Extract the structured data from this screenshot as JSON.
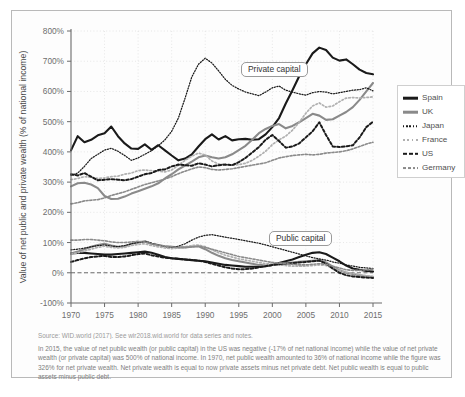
{
  "figure": {
    "source_note": "Source: WID.world (2017). See wir2018.wid.world for data series and notes.",
    "caption": "In 2015, the value of net public wealth (or public capital) in the US was negative (-17% of net national income) while the value of net private wealth (or private capital) was 500% of national income. In 1970, net public wealth amounted to 36% of national income while the figure was 326% for net private wealth. Net private wealth is equal to now private assets minus net private debt. Net public wealth is equal to public assets minus public debt."
  },
  "chart_data": {
    "type": "line",
    "title": "",
    "xlabel": "",
    "ylabel": "Value of net public and private wealth (% of national income)",
    "xlim": [
      1970,
      2015
    ],
    "ylim": [
      -100,
      800
    ],
    "ytick_labels": [
      "800%",
      "700%",
      "600%",
      "500%",
      "400%",
      "300%",
      "200%",
      "100%",
      "0%",
      "-100%"
    ],
    "yticks": [
      800,
      700,
      600,
      500,
      400,
      300,
      200,
      100,
      0,
      -100
    ],
    "xticks": [
      1970,
      1975,
      1980,
      1985,
      1990,
      1995,
      2000,
      2005,
      2010,
      2015
    ],
    "xtick_labels": [
      "1970",
      "1975",
      "1980",
      "1985",
      "1990",
      "1995",
      "2000",
      "2005",
      "2010",
      "2015"
    ],
    "grid": true,
    "legend_position": "right",
    "annotations": [
      {
        "name": "private-capital",
        "text": "Private capital"
      },
      {
        "name": "public-capital",
        "text": "Public capital"
      }
    ],
    "x": [
      1970,
      1971,
      1972,
      1973,
      1974,
      1975,
      1976,
      1977,
      1978,
      1979,
      1980,
      1981,
      1982,
      1983,
      1984,
      1985,
      1986,
      1987,
      1988,
      1989,
      1990,
      1991,
      1992,
      1993,
      1994,
      1995,
      1996,
      1997,
      1998,
      1999,
      2000,
      2001,
      2002,
      2003,
      2004,
      2005,
      2006,
      2007,
      2008,
      2009,
      2010,
      2011,
      2012,
      2013,
      2014,
      2015
    ],
    "series": [
      {
        "name": "Spain",
        "group": "private",
        "color": "#1a1a1a",
        "style": "solid",
        "width": 2.1,
        "values": [
          405,
          452,
          432,
          440,
          455,
          462,
          484,
          452,
          428,
          411,
          410,
          425,
          407,
          422,
          405,
          388,
          372,
          378,
          392,
          418,
          442,
          458,
          441,
          452,
          438,
          442,
          443,
          440,
          442,
          458,
          482,
          512,
          560,
          604,
          650,
          690,
          726,
          745,
          737,
          712,
          702,
          706,
          690,
          672,
          661,
          657
        ]
      },
      {
        "name": "UK",
        "group": "private",
        "color": "#8a8a8a",
        "style": "solid",
        "width": 2.1,
        "values": [
          286,
          296,
          298,
          292,
          280,
          254,
          244,
          245,
          252,
          262,
          270,
          278,
          286,
          296,
          312,
          326,
          342,
          355,
          368,
          382,
          388,
          382,
          378,
          382,
          392,
          406,
          420,
          440,
          462,
          476,
          486,
          492,
          478,
          486,
          498,
          512,
          526,
          520,
          506,
          508,
          520,
          532,
          548,
          572,
          600,
          628
        ]
      },
      {
        "name": "Japan",
        "group": "private",
        "color": "#1a1a1a",
        "style": "dotted",
        "width": 1.25,
        "values": [
          322,
          330,
          352,
          378,
          392,
          406,
          412,
          402,
          388,
          372,
          380,
          392,
          404,
          420,
          440,
          468,
          512,
          578,
          648,
          690,
          710,
          694,
          668,
          640,
          620,
          608,
          598,
          592,
          586,
          598,
          612,
          618,
          604,
          598,
          592,
          588,
          596,
          600,
          598,
          592,
          596,
          600,
          604,
          606,
          612,
          602
        ]
      },
      {
        "name": "France",
        "group": "private",
        "color": "#b0b0b0",
        "style": "dotted",
        "width": 1.7,
        "values": [
          308,
          312,
          318,
          316,
          312,
          314,
          318,
          320,
          326,
          330,
          338,
          340,
          338,
          336,
          334,
          340,
          356,
          372,
          386,
          396,
          390,
          370,
          360,
          358,
          356,
          358,
          362,
          372,
          386,
          402,
          424,
          440,
          452,
          472,
          498,
          528,
          552,
          562,
          548,
          552,
          566,
          578,
          580,
          578,
          580,
          582
        ]
      },
      {
        "name": "US",
        "group": "private",
        "color": "#1a1a1a",
        "style": "dashed",
        "width": 2.0,
        "values": [
          326,
          322,
          330,
          318,
          306,
          308,
          310,
          308,
          306,
          310,
          318,
          326,
          330,
          340,
          342,
          352,
          358,
          356,
          354,
          362,
          358,
          352,
          356,
          358,
          356,
          366,
          380,
          398,
          416,
          440,
          456,
          436,
          414,
          418,
          428,
          448,
          468,
          498,
          456,
          418,
          416,
          418,
          422,
          448,
          482,
          500
        ]
      },
      {
        "name": "Germany",
        "group": "private",
        "color": "#8a8a8a",
        "style": "dashed",
        "width": 1.6,
        "values": [
          228,
          232,
          238,
          240,
          242,
          248,
          256,
          262,
          268,
          276,
          284,
          292,
          298,
          304,
          310,
          318,
          328,
          336,
          344,
          350,
          348,
          342,
          340,
          342,
          344,
          348,
          352,
          356,
          360,
          364,
          372,
          380,
          384,
          388,
          390,
          392,
          390,
          392,
          396,
          398,
          400,
          404,
          410,
          418,
          426,
          432
        ]
      },
      {
        "name": "Spain",
        "group": "public",
        "color": "#1a1a1a",
        "style": "solid",
        "width": 2.1,
        "values": [
          64,
          66,
          66,
          64,
          62,
          60,
          60,
          62,
          64,
          66,
          68,
          70,
          66,
          60,
          52,
          48,
          46,
          44,
          42,
          40,
          38,
          34,
          30,
          26,
          24,
          22,
          20,
          20,
          20,
          22,
          26,
          32,
          38,
          44,
          52,
          60,
          66,
          68,
          62,
          50,
          38,
          24,
          14,
          10,
          6,
          4
        ]
      },
      {
        "name": "UK",
        "group": "public",
        "color": "#8a8a8a",
        "style": "solid",
        "width": 2.1,
        "values": [
          64,
          70,
          78,
          86,
          92,
          96,
          90,
          86,
          88,
          96,
          100,
          104,
          96,
          92,
          88,
          86,
          84,
          84,
          86,
          88,
          78,
          66,
          56,
          48,
          42,
          38,
          34,
          30,
          26,
          24,
          26,
          30,
          32,
          34,
          36,
          38,
          40,
          42,
          34,
          20,
          8,
          0,
          -4,
          -8,
          -12,
          -14
        ]
      },
      {
        "name": "Japan",
        "group": "public",
        "color": "#1a1a1a",
        "style": "dotted",
        "width": 1.25,
        "values": [
          76,
          78,
          82,
          86,
          90,
          92,
          88,
          86,
          90,
          96,
          100,
          104,
          98,
          92,
          86,
          84,
          88,
          96,
          108,
          118,
          124,
          126,
          122,
          118,
          114,
          110,
          106,
          102,
          98,
          92,
          86,
          80,
          74,
          68,
          62,
          56,
          50,
          46,
          42,
          36,
          32,
          26,
          22,
          18,
          16,
          14
        ]
      },
      {
        "name": "France",
        "group": "public",
        "color": "#b0b0b0",
        "style": "dotted",
        "width": 1.7,
        "values": [
          62,
          66,
          72,
          78,
          84,
          88,
          84,
          82,
          84,
          90,
          94,
          96,
          90,
          86,
          82,
          80,
          82,
          86,
          90,
          92,
          86,
          76,
          66,
          58,
          52,
          46,
          42,
          38,
          34,
          30,
          28,
          26,
          24,
          22,
          22,
          22,
          24,
          26,
          24,
          16,
          8,
          2,
          -2,
          -6,
          -10,
          -12
        ]
      },
      {
        "name": "US",
        "group": "public",
        "color": "#1a1a1a",
        "style": "dashed",
        "width": 2.0,
        "values": [
          36,
          42,
          48,
          52,
          54,
          56,
          52,
          52,
          54,
          58,
          62,
          64,
          58,
          54,
          50,
          48,
          46,
          44,
          42,
          40,
          36,
          30,
          24,
          18,
          14,
          12,
          12,
          14,
          18,
          22,
          26,
          28,
          30,
          32,
          34,
          36,
          38,
          40,
          30,
          14,
          0,
          -8,
          -12,
          -14,
          -16,
          -17
        ]
      },
      {
        "name": "Germany",
        "group": "public",
        "color": "#8a8a8a",
        "style": "dashed",
        "width": 1.6,
        "values": [
          108,
          108,
          110,
          110,
          108,
          106,
          102,
          100,
          100,
          102,
          104,
          102,
          96,
          92,
          88,
          86,
          84,
          84,
          86,
          88,
          84,
          78,
          72,
          66,
          60,
          54,
          50,
          46,
          42,
          38,
          34,
          32,
          30,
          28,
          26,
          26,
          28,
          30,
          28,
          22,
          16,
          10,
          8,
          8,
          10,
          12
        ]
      }
    ],
    "legend": [
      {
        "label": "Spain",
        "color": "#1a1a1a",
        "style": "solid",
        "width": 2.6
      },
      {
        "label": "UK",
        "color": "#8a8a8a",
        "style": "solid",
        "width": 2.6
      },
      {
        "label": "Japan",
        "color": "#1a1a1a",
        "style": "dotted",
        "width": 1.5
      },
      {
        "label": "France",
        "color": "#b0b0b0",
        "style": "dotted",
        "width": 2.0
      },
      {
        "label": "US",
        "color": "#1a1a1a",
        "style": "dashed",
        "width": 2.4
      },
      {
        "label": "Germany",
        "color": "#8a8a8a",
        "style": "dashed",
        "width": 1.9
      }
    ]
  }
}
